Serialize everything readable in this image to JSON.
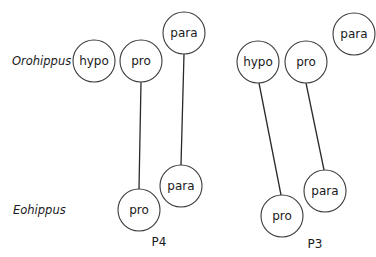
{
  "rows": {
    "top": "Orohippus",
    "bottom": "Eohippus"
  },
  "groups": [
    {
      "label": "P4",
      "nodes": [
        {
          "id": "p4-oro-hypo",
          "text": "hypo",
          "cx": 94,
          "cy": 61
        },
        {
          "id": "p4-oro-pro",
          "text": "pro",
          "cx": 141,
          "cy": 61
        },
        {
          "id": "p4-oro-para",
          "text": "para",
          "cx": 184,
          "cy": 33
        },
        {
          "id": "p4-eo-pro",
          "text": "pro",
          "cx": 139,
          "cy": 210
        },
        {
          "id": "p4-eo-para",
          "text": "para",
          "cx": 181,
          "cy": 186
        }
      ],
      "links": [
        [
          "p4-oro-pro",
          "p4-eo-pro"
        ],
        [
          "p4-oro-para",
          "p4-eo-para"
        ]
      ]
    },
    {
      "label": "P3",
      "nodes": [
        {
          "id": "p3-oro-hypo",
          "text": "hypo",
          "cx": 258,
          "cy": 62
        },
        {
          "id": "p3-oro-pro",
          "text": "pro",
          "cx": 306,
          "cy": 62
        },
        {
          "id": "p3-oro-para",
          "text": "para",
          "cx": 354,
          "cy": 34
        },
        {
          "id": "p3-eo-pro",
          "text": "pro",
          "cx": 282,
          "cy": 216
        },
        {
          "id": "p3-eo-para",
          "text": "para",
          "cx": 325,
          "cy": 191
        }
      ],
      "links": [
        [
          "p3-oro-hypo",
          "p3-eo-pro"
        ],
        [
          "p3-oro-pro",
          "p3-eo-para"
        ]
      ]
    }
  ],
  "labels": {
    "p4": "P4",
    "p3": "P3"
  }
}
